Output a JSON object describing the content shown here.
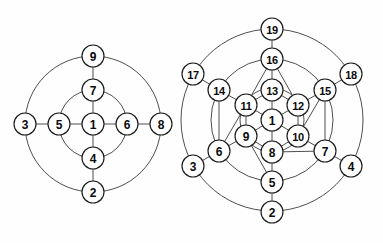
{
  "figure": {
    "title": "",
    "background_color": "#fefefe",
    "stroke_color": "#1a1a1a",
    "ring_color": "#3a3a3a",
    "node_fill": "#ffffff"
  },
  "diagrams": [
    {
      "id": "left-diagram",
      "name": "nine-node-concentric-diagram",
      "center": {
        "x": 93,
        "y": 124
      },
      "node_radius": 11,
      "rings": [
        {
          "name": "inner-ring",
          "radius": 34
        },
        {
          "name": "outer-ring",
          "radius": 68
        }
      ],
      "nodes": [
        {
          "id": "L1",
          "label": "1",
          "x": 93,
          "y": 124,
          "shell": 0,
          "angle_deg": 0
        },
        {
          "id": "L7",
          "label": "7",
          "x": 93,
          "y": 90,
          "shell": 1,
          "angle_deg": 90
        },
        {
          "id": "L6",
          "label": "6",
          "x": 127,
          "y": 124,
          "shell": 1,
          "angle_deg": 0
        },
        {
          "id": "L4",
          "label": "4",
          "x": 93,
          "y": 158,
          "shell": 1,
          "angle_deg": 270
        },
        {
          "id": "L5",
          "label": "5",
          "x": 59,
          "y": 124,
          "shell": 1,
          "angle_deg": 180
        },
        {
          "id": "L9",
          "label": "9",
          "x": 93,
          "y": 56,
          "shell": 2,
          "angle_deg": 90
        },
        {
          "id": "L8",
          "label": "8",
          "x": 161,
          "y": 124,
          "shell": 2,
          "angle_deg": 0
        },
        {
          "id": "L2",
          "label": "2",
          "x": 93,
          "y": 192,
          "shell": 2,
          "angle_deg": 270
        },
        {
          "id": "L3",
          "label": "3",
          "x": 25,
          "y": 124,
          "shell": 2,
          "angle_deg": 180
        }
      ],
      "edges": [
        [
          "L1",
          "L7"
        ],
        [
          "L1",
          "L6"
        ],
        [
          "L1",
          "L4"
        ],
        [
          "L1",
          "L5"
        ],
        [
          "L7",
          "L9"
        ],
        [
          "L6",
          "L8"
        ],
        [
          "L4",
          "L2"
        ],
        [
          "L5",
          "L3"
        ]
      ]
    },
    {
      "id": "right-diagram",
      "name": "nineteen-node-concentric-diagram",
      "center": {
        "x": 272,
        "y": 120
      },
      "node_radius": 11,
      "rings": [
        {
          "name": "inner-ring",
          "radius": 32
        },
        {
          "name": "middle-ring",
          "radius": 61
        },
        {
          "name": "outer-ring",
          "radius": 91
        }
      ],
      "nodes": [
        {
          "id": "R1",
          "label": "1",
          "x": 272,
          "y": 120,
          "shell": 0,
          "angle_deg": 0
        },
        {
          "id": "R13",
          "label": "13",
          "x": 272,
          "y": 90,
          "shell": 1,
          "angle_deg": 90
        },
        {
          "id": "R12",
          "label": "12",
          "x": 298,
          "y": 105,
          "shell": 1,
          "angle_deg": 30
        },
        {
          "id": "R10",
          "label": "10",
          "x": 298,
          "y": 136,
          "shell": 1,
          "angle_deg": 330
        },
        {
          "id": "R8",
          "label": "8",
          "x": 272,
          "y": 152,
          "shell": 1,
          "angle_deg": 270
        },
        {
          "id": "R9",
          "label": "9",
          "x": 246,
          "y": 136,
          "shell": 1,
          "angle_deg": 210
        },
        {
          "id": "R11",
          "label": "11",
          "x": 246,
          "y": 105,
          "shell": 1,
          "angle_deg": 150
        },
        {
          "id": "R16",
          "label": "16",
          "x": 272,
          "y": 59,
          "shell": 2,
          "angle_deg": 90
        },
        {
          "id": "R15",
          "label": "15",
          "x": 325,
          "y": 90,
          "shell": 2,
          "angle_deg": 30
        },
        {
          "id": "R7",
          "label": "7",
          "x": 325,
          "y": 151,
          "shell": 2,
          "angle_deg": 330
        },
        {
          "id": "R5",
          "label": "5",
          "x": 272,
          "y": 182,
          "shell": 2,
          "angle_deg": 270
        },
        {
          "id": "R6",
          "label": "6",
          "x": 219,
          "y": 151,
          "shell": 2,
          "angle_deg": 210
        },
        {
          "id": "R14",
          "label": "14",
          "x": 219,
          "y": 90,
          "shell": 2,
          "angle_deg": 150
        },
        {
          "id": "R19",
          "label": "19",
          "x": 272,
          "y": 29,
          "shell": 3,
          "angle_deg": 90
        },
        {
          "id": "R18",
          "label": "18",
          "x": 351,
          "y": 74,
          "shell": 3,
          "angle_deg": 30
        },
        {
          "id": "R4",
          "label": "4",
          "x": 351,
          "y": 166,
          "shell": 3,
          "angle_deg": 330
        },
        {
          "id": "R2",
          "label": "2",
          "x": 272,
          "y": 212,
          "shell": 3,
          "angle_deg": 270
        },
        {
          "id": "R3",
          "label": "3",
          "x": 193,
          "y": 166,
          "shell": 3,
          "angle_deg": 210
        },
        {
          "id": "R17",
          "label": "17",
          "x": 193,
          "y": 74,
          "shell": 3,
          "angle_deg": 150
        }
      ],
      "edges": [
        [
          "R1",
          "R13"
        ],
        [
          "R1",
          "R12"
        ],
        [
          "R1",
          "R10"
        ],
        [
          "R1",
          "R8"
        ],
        [
          "R1",
          "R9"
        ],
        [
          "R1",
          "R11"
        ],
        [
          "R13",
          "R11"
        ],
        [
          "R13",
          "R12"
        ],
        [
          "R12",
          "R10"
        ],
        [
          "R10",
          "R8"
        ],
        [
          "R8",
          "R9"
        ],
        [
          "R9",
          "R11"
        ],
        [
          "R13",
          "R16"
        ],
        [
          "R12",
          "R15"
        ],
        [
          "R10",
          "R7"
        ],
        [
          "R8",
          "R5"
        ],
        [
          "R9",
          "R6"
        ],
        [
          "R11",
          "R14"
        ],
        [
          "R16",
          "R19"
        ],
        [
          "R15",
          "R18"
        ],
        [
          "R7",
          "R4"
        ],
        [
          "R5",
          "R2"
        ],
        [
          "R6",
          "R3"
        ],
        [
          "R14",
          "R17"
        ],
        [
          "R11",
          "R14"
        ],
        [
          "R11",
          "R16"
        ],
        [
          "R12",
          "R16"
        ],
        [
          "R12",
          "R15"
        ],
        [
          "R10",
          "R15"
        ],
        [
          "R10",
          "R7"
        ],
        [
          "R8",
          "R7"
        ],
        [
          "R8",
          "R5"
        ],
        [
          "R9",
          "R5"
        ],
        [
          "R9",
          "R6"
        ],
        [
          "R11",
          "R6"
        ],
        [
          "R13",
          "R16"
        ],
        [
          "R14",
          "R6"
        ],
        [
          "R15",
          "R7"
        ]
      ]
    }
  ]
}
